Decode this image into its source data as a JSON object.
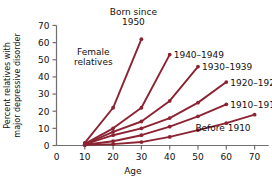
{
  "chart_data": {
    "type": "line",
    "title": "",
    "xlabel": "Age",
    "ylabel": "Percent relatives with major depressive disorder",
    "ylabel_line1": "Percent relatives with",
    "ylabel_line2": "major depressive disorder",
    "xlim": [
      0,
      75
    ],
    "ylim": [
      0,
      70
    ],
    "xticks": [
      0,
      10,
      20,
      30,
      40,
      50,
      60,
      70
    ],
    "yticks": [
      0,
      10,
      20,
      30,
      40,
      50,
      60,
      70
    ],
    "grid": false,
    "legend_position": "inline-end-of-line",
    "line_color": "#8B2332",
    "marker_color": "#8B2332",
    "annotations": [
      {
        "text": "Female",
        "x": 13,
        "y": 53
      },
      {
        "text": "relatives",
        "x": 13,
        "y": 47
      }
    ],
    "series": [
      {
        "name": "Born since 1950",
        "label": "Born since",
        "label2": "1950",
        "x": [
          10,
          20,
          30
        ],
        "y": [
          1.5,
          22,
          62
        ]
      },
      {
        "name": "1940-1949",
        "label": "1940–1949",
        "x": [
          10,
          20,
          30,
          40
        ],
        "y": [
          1.0,
          10,
          22,
          53
        ]
      },
      {
        "name": "1930-1939",
        "label": "1930–1939",
        "x": [
          10,
          20,
          30,
          40,
          50
        ],
        "y": [
          0.8,
          8,
          14,
          26,
          46
        ]
      },
      {
        "name": "1920-1929",
        "label": "1920–1929",
        "x": [
          10,
          20,
          30,
          40,
          50,
          60
        ],
        "y": [
          0.6,
          6,
          10,
          16,
          25,
          37
        ]
      },
      {
        "name": "1910-1919",
        "label": "1910–1919",
        "x": [
          10,
          20,
          30,
          40,
          50,
          60
        ],
        "y": [
          0.4,
          2.5,
          6,
          11,
          17,
          24
        ]
      },
      {
        "name": "Before 1910",
        "label": "Before 1910",
        "x": [
          10,
          20,
          30,
          40,
          50,
          60,
          70
        ],
        "y": [
          0.2,
          0.8,
          2,
          5,
          9,
          13,
          18
        ]
      }
    ]
  }
}
